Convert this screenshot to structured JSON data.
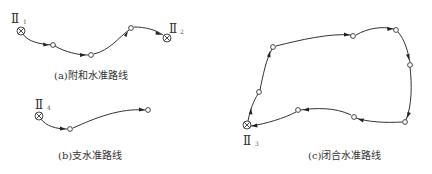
{
  "diagram": {
    "colors": {
      "line": "#333333",
      "background": "#ffffff"
    },
    "panels": {
      "a": {
        "caption": "(a)附和水准路线",
        "start_benchmark": {
          "roman": "Ⅱ",
          "sub": "1"
        },
        "end_benchmark": {
          "roman": "Ⅱ",
          "sub": "2"
        },
        "intermediate_points": 3,
        "type": "annexed leveling route"
      },
      "b": {
        "caption": "(b)支水准路线",
        "start_benchmark": {
          "roman": "Ⅱ",
          "sub": "4"
        },
        "intermediate_points": 2,
        "type": "spur leveling route"
      },
      "c": {
        "caption": "(c)闭合水准路线",
        "start_benchmark": {
          "roman": "Ⅱ",
          "sub": "3"
        },
        "intermediate_points": 9,
        "type": "closed leveling route"
      }
    },
    "legend_symbols": {
      "benchmark": "circle-with-x-icon",
      "turning_point": "open-circle-icon",
      "direction": "arrowhead-icon"
    }
  }
}
